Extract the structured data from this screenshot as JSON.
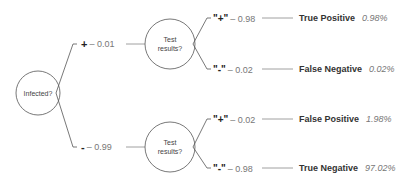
{
  "diagram": {
    "type": "probability-tree",
    "root": {
      "label": "Infected?"
    },
    "level1": [
      {
        "sign": "+",
        "prob_text": "– 0.01",
        "node_label_line1": "Test",
        "node_label_line2": "results?",
        "children": [
          {
            "sign": "\"+\"",
            "prob_text": "– 0.98",
            "outcome": "True Positive",
            "pct": "0.98%"
          },
          {
            "sign": "\"-\"",
            "prob_text": "– 0.02",
            "outcome": "False Negative",
            "pct": "0.02%"
          }
        ]
      },
      {
        "sign": "-",
        "prob_text": "– 0.99",
        "node_label_line1": "Test",
        "node_label_line2": "results?",
        "children": [
          {
            "sign": "\"+\"",
            "prob_text": "– 0.02",
            "outcome": "False Positive",
            "pct": "1.98%"
          },
          {
            "sign": "\"-\"",
            "prob_text": "– 0.98",
            "outcome": "True Negative",
            "pct": "97.02%"
          }
        ]
      }
    ]
  },
  "colors": {
    "line": "#555555",
    "connector": "#888888",
    "text": "#333333",
    "muted": "#777777"
  }
}
